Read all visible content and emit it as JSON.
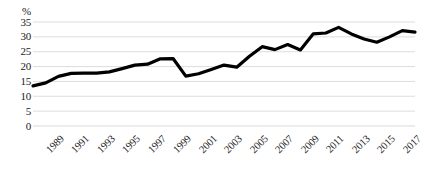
{
  "chart_data": {
    "type": "line",
    "title": "",
    "subtitle": "",
    "xlabel": "",
    "ylabel": "%",
    "ylim": [
      0,
      35
    ],
    "ytick_labels": [
      "35",
      "30",
      "25",
      "20",
      "15",
      "10",
      "5",
      "0"
    ],
    "ytick_values": [
      35,
      30,
      25,
      20,
      15,
      10,
      5,
      0
    ],
    "grid": true,
    "legend": "none",
    "xtick_labels": [
      "1989",
      "1991",
      "1993",
      "1995",
      "1997",
      "1999",
      "2001",
      "2003",
      "2005",
      "2007",
      "2009",
      "2011",
      "2013",
      "2015",
      "2017",
      "2019"
    ],
    "xtick_values": [
      1989,
      1991,
      1993,
      1995,
      1997,
      1999,
      2001,
      2003,
      2005,
      2007,
      2009,
      2011,
      2013,
      2015,
      2017,
      2019
    ],
    "x": [
      1989,
      1990,
      1991,
      1992,
      1993,
      1994,
      1995,
      1996,
      1997,
      1998,
      1999,
      2000,
      2001,
      2002,
      2003,
      2004,
      2005,
      2006,
      2007,
      2008,
      2009,
      2010,
      2011,
      2012,
      2013,
      2014,
      2015,
      2016,
      2017,
      2018,
      2019
    ],
    "values": [
      13.5,
      14.5,
      16.7,
      17.7,
      17.8,
      17.8,
      18.2,
      19.3,
      20.5,
      20.8,
      22.6,
      22.7,
      16.8,
      17.6,
      19.0,
      20.5,
      19.8,
      23.5,
      26.7,
      25.7,
      27.4,
      25.6,
      31.0,
      31.3,
      33.2,
      31.0,
      29.3,
      28.2,
      30.0,
      32.1,
      31.6
    ],
    "series_name": "",
    "line_color": "#000000",
    "grid_color": "#d9d9d9",
    "text_color": "#1a1a1a",
    "background_color": "#ffffff",
    "line_width": 3.2
  }
}
